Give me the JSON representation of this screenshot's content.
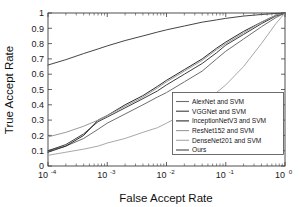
{
  "chart_data": {
    "type": "line",
    "title": "",
    "xlabel": "False Accept Rate",
    "ylabel": "True Accept Rate",
    "xscale": "log",
    "yscale": "linear",
    "xlim": [
      0.0001,
      1
    ],
    "ylim": [
      0,
      1
    ],
    "grid": false,
    "legend_position": "lower right",
    "xticklabels": [
      "10-4",
      "10-3",
      "10-2",
      "10-1",
      "100"
    ],
    "xtick_mantissa": [
      "10",
      "10",
      "10",
      "10",
      "10"
    ],
    "xtick_exponents": [
      "-4",
      "-3",
      "-2",
      "-1",
      "0"
    ],
    "yticklabels": [
      "0",
      "0.1",
      "0.2",
      "0.3",
      "0.4",
      "0.5",
      "0.6",
      "0.7",
      "0.8",
      "0.9",
      "1"
    ],
    "ytickvalues": [
      0,
      0.1,
      0.2,
      0.3,
      0.4,
      0.5,
      0.6,
      0.7,
      0.8,
      0.9,
      1
    ],
    "series": [
      {
        "name": "AlexNet and SVM",
        "color": "#6e6e6e",
        "x": [
          0.0001,
          0.0002,
          0.0004,
          0.0007,
          0.001,
          0.002,
          0.004,
          0.007,
          0.01,
          0.02,
          0.04,
          0.07,
          0.1,
          0.2,
          0.4,
          0.7,
          1.0
        ],
        "y": [
          0.1,
          0.13,
          0.18,
          0.24,
          0.28,
          0.34,
          0.4,
          0.45,
          0.48,
          0.55,
          0.62,
          0.7,
          0.75,
          0.83,
          0.91,
          0.97,
          1.0
        ]
      },
      {
        "name": "VGGNet and SVM",
        "color": "#3d3d3d",
        "x": [
          0.0001,
          0.0002,
          0.0004,
          0.0007,
          0.001,
          0.002,
          0.004,
          0.007,
          0.01,
          0.02,
          0.04,
          0.07,
          0.1,
          0.2,
          0.4,
          0.7,
          1.0
        ],
        "y": [
          0.1,
          0.14,
          0.21,
          0.29,
          0.32,
          0.38,
          0.44,
          0.49,
          0.53,
          0.6,
          0.67,
          0.74,
          0.79,
          0.86,
          0.93,
          0.98,
          1.0
        ]
      },
      {
        "name": "InceptionNetV3 and SVM",
        "color": "#2a2a2a",
        "x": [
          0.0001,
          0.0002,
          0.0004,
          0.0007,
          0.001,
          0.002,
          0.004,
          0.007,
          0.01,
          0.02,
          0.04,
          0.07,
          0.1,
          0.2,
          0.4,
          0.7,
          1.0
        ],
        "y": [
          0.09,
          0.13,
          0.2,
          0.3,
          0.33,
          0.4,
          0.46,
          0.52,
          0.56,
          0.63,
          0.7,
          0.77,
          0.81,
          0.88,
          0.94,
          0.985,
          1.0
        ]
      },
      {
        "name": "ResNet152 and SVM",
        "color": "#9a9a9a",
        "x": [
          0.0001,
          0.0002,
          0.0004,
          0.0007,
          0.001,
          0.002,
          0.004,
          0.007,
          0.01,
          0.02,
          0.04,
          0.07,
          0.1,
          0.2,
          0.4,
          0.7,
          1.0
        ],
        "y": [
          0.19,
          0.22,
          0.26,
          0.3,
          0.33,
          0.39,
          0.45,
          0.51,
          0.55,
          0.62,
          0.69,
          0.76,
          0.8,
          0.87,
          0.94,
          0.985,
          1.0
        ]
      },
      {
        "name": "DenseNet201 and SVM",
        "color": "#a8a8a8",
        "x": [
          0.0001,
          0.0002,
          0.0004,
          0.0007,
          0.001,
          0.002,
          0.004,
          0.007,
          0.01,
          0.02,
          0.04,
          0.07,
          0.1,
          0.2,
          0.4,
          0.7,
          1.0
        ],
        "y": [
          0.07,
          0.09,
          0.11,
          0.13,
          0.15,
          0.18,
          0.22,
          0.25,
          0.28,
          0.34,
          0.41,
          0.48,
          0.53,
          0.65,
          0.8,
          0.93,
          1.0
        ]
      },
      {
        "name": "Ours",
        "color": "#454545",
        "x": [
          0.0001,
          0.0002,
          0.0004,
          0.0007,
          0.001,
          0.002,
          0.004,
          0.007,
          0.01,
          0.02,
          0.04,
          0.07,
          0.1,
          0.2,
          0.4,
          0.7,
          1.0
        ],
        "y": [
          0.66,
          0.695,
          0.735,
          0.765,
          0.785,
          0.82,
          0.85,
          0.875,
          0.89,
          0.915,
          0.94,
          0.955,
          0.965,
          0.98,
          0.99,
          0.997,
          1.0
        ]
      }
    ]
  }
}
